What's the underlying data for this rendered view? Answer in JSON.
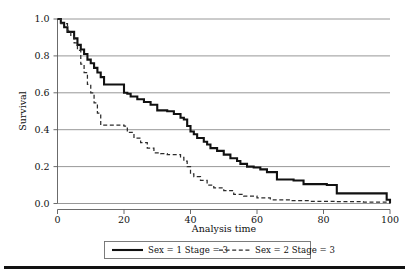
{
  "chart_data": {
    "type": "line",
    "title": "",
    "subtitle": "",
    "xlabel": "Analysis time",
    "ylabel": "Survival",
    "xlim": [
      0,
      100
    ],
    "ylim": [
      0.0,
      1.0
    ],
    "xticks": [
      0,
      20,
      40,
      60,
      80,
      100
    ],
    "xtick_labels": [
      "0",
      "20",
      "40",
      "60",
      "80",
      "100"
    ],
    "yticks": [
      0.0,
      0.2,
      0.4,
      0.6,
      0.8,
      1.0
    ],
    "ytick_labels": [
      "0.0",
      "0.2",
      "0.4",
      "0.6",
      "0.8",
      "1.0"
    ],
    "grid": "horizontal",
    "legend_position": "below-axis-centered",
    "step_style": "post",
    "series": [
      {
        "name": "Sex = 1  Stage = 3",
        "style": "solid",
        "color": "#111111",
        "x": [
          0,
          1,
          2,
          3,
          5,
          6,
          7,
          8,
          9,
          10,
          11,
          12,
          13,
          14,
          20,
          21,
          22,
          24,
          26,
          28,
          30,
          33,
          35,
          37,
          38,
          39,
          40,
          41,
          42,
          44,
          45,
          46,
          48,
          50,
          52,
          54,
          55,
          57,
          59,
          61,
          63,
          66,
          71,
          74,
          81,
          84,
          89,
          99,
          100
        ],
        "y": [
          1.0,
          0.98,
          0.955,
          0.93,
          0.895,
          0.86,
          0.835,
          0.81,
          0.78,
          0.76,
          0.735,
          0.71,
          0.685,
          0.645,
          0.6,
          0.595,
          0.58,
          0.565,
          0.55,
          0.535,
          0.505,
          0.5,
          0.485,
          0.465,
          0.455,
          0.42,
          0.39,
          0.375,
          0.355,
          0.335,
          0.32,
          0.3,
          0.285,
          0.265,
          0.245,
          0.23,
          0.215,
          0.2,
          0.195,
          0.185,
          0.17,
          0.13,
          0.125,
          0.105,
          0.1,
          0.055,
          0.055,
          0.02,
          0.0
        ]
      },
      {
        "name": "Sex = 2  Stage = 3",
        "style": "dashed",
        "color": "#2b2b2b",
        "x": [
          0,
          1,
          3,
          4,
          5,
          6,
          7,
          8,
          9,
          10,
          11,
          12,
          13,
          20,
          21,
          23,
          25,
          27,
          29,
          31,
          33,
          35,
          37,
          38,
          39,
          40,
          41,
          43,
          45,
          47,
          50,
          53,
          56,
          60,
          64,
          70,
          76,
          84,
          92,
          100
        ],
        "y": [
          1.0,
          0.975,
          0.935,
          0.905,
          0.87,
          0.83,
          0.755,
          0.71,
          0.645,
          0.6,
          0.545,
          0.49,
          0.425,
          0.42,
          0.385,
          0.355,
          0.33,
          0.3,
          0.275,
          0.27,
          0.265,
          0.265,
          0.25,
          0.23,
          0.2,
          0.16,
          0.145,
          0.125,
          0.1,
          0.085,
          0.07,
          0.05,
          0.04,
          0.03,
          0.02,
          0.015,
          0.012,
          0.01,
          0.008,
          0.005
        ]
      }
    ]
  },
  "legend": {
    "entries": [
      {
        "label": "Sex = 1  Stage = 3",
        "style": "solid"
      },
      {
        "label": "Sex = 2  Stage = 3",
        "style": "dashed"
      }
    ]
  },
  "axes": {
    "y_title": "Survival",
    "x_title": "Analysis time"
  }
}
